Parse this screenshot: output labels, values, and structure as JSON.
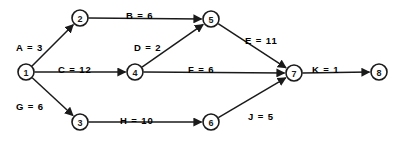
{
  "diagram": {
    "type": "activity-on-arrow network diagram",
    "colors": {
      "stroke": "#1a1a1a",
      "node_fill": "#ffffff",
      "background": "#ffffff"
    },
    "nodes": [
      {
        "id": "1",
        "label": "1",
        "cx": 26,
        "cy": 72,
        "r": 8
      },
      {
        "id": "2",
        "label": "2",
        "cx": 80,
        "cy": 18,
        "r": 8
      },
      {
        "id": "3",
        "label": "3",
        "cx": 80,
        "cy": 122,
        "r": 8
      },
      {
        "id": "4",
        "label": "4",
        "cx": 135,
        "cy": 72,
        "r": 8
      },
      {
        "id": "5",
        "label": "5",
        "cx": 211,
        "cy": 19,
        "r": 8
      },
      {
        "id": "6",
        "label": "6",
        "cx": 211,
        "cy": 122,
        "r": 8
      },
      {
        "id": "7",
        "label": "7",
        "cx": 294,
        "cy": 73,
        "r": 8
      },
      {
        "id": "8",
        "label": "8",
        "cx": 379,
        "cy": 72,
        "r": 8
      }
    ],
    "edges": [
      {
        "id": "A",
        "activity": "A",
        "duration": 3,
        "label": "A = 3",
        "from": "1",
        "to": "2",
        "label_x": 16,
        "label_y": 42
      },
      {
        "id": "B",
        "activity": "B",
        "duration": 6,
        "label": "B = 6",
        "from": "2",
        "to": "5",
        "label_x": 126,
        "label_y": 10
      },
      {
        "id": "C",
        "activity": "C",
        "duration": 12,
        "label": "C = 12",
        "from": "1",
        "to": "4",
        "label_x": 58,
        "label_y": 64
      },
      {
        "id": "D",
        "activity": "D",
        "duration": 2,
        "label": "D = 2",
        "from": "4",
        "to": "5",
        "label_x": 134,
        "label_y": 42
      },
      {
        "id": "E",
        "activity": "E",
        "duration": 11,
        "label": "E = 11",
        "from": "5",
        "to": "7",
        "label_x": 245,
        "label_y": 35
      },
      {
        "id": "F",
        "activity": "F",
        "duration": 6,
        "label": "F = 6",
        "from": "4",
        "to": "7",
        "label_x": 188,
        "label_y": 64
      },
      {
        "id": "G",
        "activity": "G",
        "duration": 6,
        "label": "G = 6",
        "from": "1",
        "to": "3",
        "label_x": 16,
        "label_y": 101
      },
      {
        "id": "H",
        "activity": "H",
        "duration": 10,
        "label": "H = 10",
        "from": "3",
        "to": "6",
        "label_x": 120,
        "label_y": 115
      },
      {
        "id": "J",
        "activity": "J",
        "duration": 5,
        "label": "J = 5",
        "from": "6",
        "to": "7",
        "label_x": 248,
        "label_y": 111
      },
      {
        "id": "K",
        "activity": "K",
        "duration": 1,
        "label": "K = 1",
        "from": "7",
        "to": "8",
        "label_x": 312,
        "label_y": 64
      }
    ]
  }
}
